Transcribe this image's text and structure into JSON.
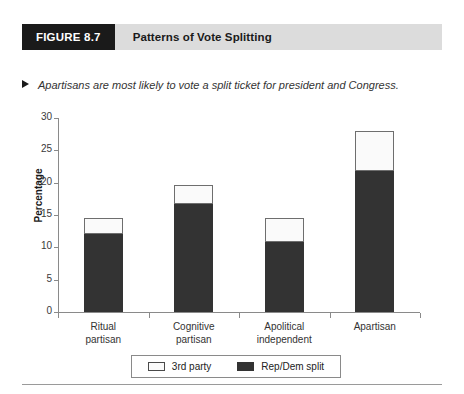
{
  "figure": {
    "number_label": "FIGURE 8.7",
    "title": "Patterns of Vote Splitting",
    "subtitle": "Apartisans are most likely to vote a split ticket for president and Congress.",
    "marker_icon": "triangle-right-icon"
  },
  "colors": {
    "header_block": "#1a1a1a",
    "header_band": "#dcdcdc",
    "dark_series": "#333333",
    "light_series": "#fafafa",
    "axis": "#8a8a8a"
  },
  "legend": {
    "items": [
      {
        "label": "3rd party",
        "swatch": "light"
      },
      {
        "label": "Rep/Dem split",
        "swatch": "dark"
      }
    ]
  },
  "chart_data": {
    "type": "bar",
    "subtype": "stacked",
    "title": "Patterns of Vote Splitting",
    "subtitle": "Apartisans are most likely to vote a split ticket for president and Congress.",
    "xlabel": "",
    "ylabel": "Percentage",
    "ylim": [
      0,
      30
    ],
    "yticks": [
      0,
      5,
      10,
      15,
      20,
      25,
      30
    ],
    "ytick_labels": [
      "0",
      "5",
      "10",
      "15",
      "20",
      "25",
      "30"
    ],
    "grid": false,
    "legend_position": "bottom",
    "categories": [
      "Ritual partisan",
      "Cognitive partisan",
      "Apolitical independent",
      "Apartisan"
    ],
    "category_lines": [
      [
        "Ritual",
        "partisan"
      ],
      [
        "Cognitive",
        "partisan"
      ],
      [
        "Apolitical",
        "independent"
      ],
      [
        "Apartisan",
        ""
      ]
    ],
    "series": [
      {
        "name": "Rep/Dem split",
        "color": "#333333",
        "values": [
          12.1,
          16.7,
          10.8,
          21.8
        ]
      },
      {
        "name": "3rd party",
        "color": "#fafafa",
        "values": [
          2.4,
          2.9,
          3.8,
          6.2
        ]
      }
    ],
    "totals": [
      14.5,
      19.6,
      14.6,
      28.0
    ]
  }
}
